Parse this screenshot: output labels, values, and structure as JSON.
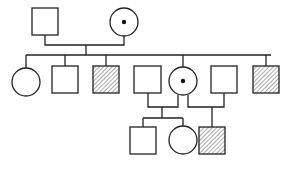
{
  "diagram": {
    "type": "pedigree",
    "legend_semantics": {
      "square": "male",
      "circle": "female",
      "hatched": "affected",
      "dot": "carrier"
    },
    "generations": [
      {
        "label": "I",
        "individuals": [
          {
            "id": "I-1",
            "sex": "male",
            "status": "unaffected"
          },
          {
            "id": "I-2",
            "sex": "female",
            "status": "carrier"
          }
        ]
      },
      {
        "label": "II",
        "individuals": [
          {
            "id": "II-1",
            "sex": "female",
            "status": "unaffected"
          },
          {
            "id": "II-2",
            "sex": "male",
            "status": "unaffected"
          },
          {
            "id": "II-3",
            "sex": "male",
            "status": "affected"
          },
          {
            "id": "II-4",
            "sex": "male",
            "status": "unaffected",
            "note": "married-in"
          },
          {
            "id": "II-5",
            "sex": "female",
            "status": "carrier"
          },
          {
            "id": "II-6",
            "sex": "male",
            "status": "unaffected",
            "note": "married-in"
          },
          {
            "id": "II-7",
            "sex": "male",
            "status": "affected"
          }
        ]
      },
      {
        "label": "III",
        "individuals": [
          {
            "id": "III-1",
            "sex": "male",
            "status": "unaffected",
            "parents": [
              "II-4",
              "II-5"
            ]
          },
          {
            "id": "III-2",
            "sex": "female",
            "status": "unaffected",
            "parents": [
              "II-4",
              "II-5"
            ]
          },
          {
            "id": "III-3",
            "sex": "male",
            "status": "affected",
            "parents": [
              "II-5",
              "II-6"
            ]
          }
        ]
      }
    ]
  }
}
